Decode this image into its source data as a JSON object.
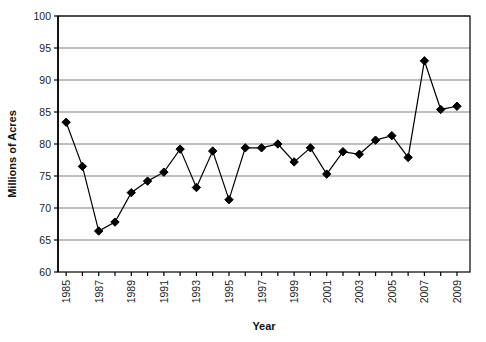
{
  "chart_data": {
    "type": "line",
    "title": "",
    "xlabel": "Year",
    "ylabel": "Millions of Acres",
    "x": [
      1985,
      1986,
      1987,
      1988,
      1989,
      1990,
      1991,
      1992,
      1993,
      1994,
      1995,
      1996,
      1997,
      1998,
      1999,
      2000,
      2001,
      2002,
      2003,
      2004,
      2005,
      2006,
      2007,
      2008,
      2009
    ],
    "values": [
      83.4,
      76.5,
      66.4,
      67.8,
      72.4,
      74.2,
      75.6,
      79.2,
      73.2,
      78.9,
      71.3,
      79.4,
      79.4,
      80.0,
      77.2,
      79.4,
      75.3,
      78.8,
      78.4,
      80.6,
      81.3,
      77.9,
      93.0,
      85.4,
      85.9
    ],
    "series": [
      {
        "name": "Acres Planted",
        "values": [
          83.4,
          76.5,
          66.4,
          67.8,
          72.4,
          74.2,
          75.6,
          79.2,
          73.2,
          78.9,
          71.3,
          79.4,
          79.4,
          80.0,
          77.2,
          79.4,
          75.3,
          78.8,
          78.4,
          80.6,
          81.3,
          77.9,
          93.0,
          85.4,
          85.9
        ]
      }
    ],
    "xlim": [
      1984.5,
      2009.8
    ],
    "ylim": [
      60,
      100
    ],
    "ytick_values": [
      60,
      65,
      70,
      75,
      80,
      85,
      90,
      95,
      100
    ],
    "ytick_labels": [
      "60",
      "65",
      "70",
      "75",
      "80",
      "85",
      "90",
      "95",
      "100"
    ],
    "xtick_values": [
      1985,
      1986,
      1987,
      1988,
      1989,
      1990,
      1991,
      1992,
      1993,
      1994,
      1995,
      1996,
      1997,
      1998,
      1999,
      2000,
      2001,
      2002,
      2003,
      2004,
      2005,
      2006,
      2007,
      2008,
      2009
    ],
    "xtick_labels_shown": [
      "1985",
      "1987",
      "1989",
      "1991",
      "1993",
      "1995",
      "1997",
      "1999",
      "2001",
      "2003",
      "2005",
      "2007",
      "2009"
    ],
    "xtick_label_years": [
      1985,
      1987,
      1989,
      1991,
      1993,
      1995,
      1997,
      1999,
      2001,
      2003,
      2005,
      2007,
      2009
    ],
    "grid": {
      "horizontal": true,
      "vertical": false
    },
    "legend": {
      "visible": false,
      "position": "none"
    },
    "marker": "diamond",
    "marker_color": "#000000",
    "line_color": "#000000",
    "gridline_color": "#808080",
    "axis_color": "#000000",
    "plot_background": "#ffffff"
  }
}
